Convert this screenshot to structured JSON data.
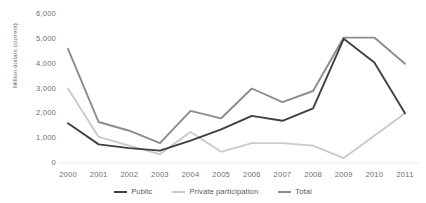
{
  "chart_data": {
    "type": "line",
    "title": "",
    "xlabel": "",
    "ylabel": "Million dollars (current)",
    "categories": [
      "2000",
      "2001",
      "2002",
      "2003",
      "2004",
      "2005",
      "2006",
      "2007",
      "2008",
      "2009",
      "2010",
      "2011"
    ],
    "ylim": [
      0,
      6000
    ],
    "ytick_labels": [
      "0",
      "1,000",
      "2,000",
      "3,000",
      "4,000",
      "5,000",
      "6,000"
    ],
    "ytick_values": [
      0,
      1000,
      2000,
      3000,
      4000,
      5000,
      6000
    ],
    "grid": false,
    "legend_position": "bottom",
    "series": [
      {
        "name": "Public",
        "color": "#404040",
        "values": [
          1600,
          750,
          600,
          500,
          900,
          1350,
          1900,
          1700,
          2200,
          5000,
          4050,
          2000
        ]
      },
      {
        "name": "Private participation",
        "color": "#c9cacc",
        "values": [
          3000,
          1050,
          700,
          350,
          1250,
          450,
          800,
          800,
          700,
          200,
          1100,
          2000
        ]
      },
      {
        "name": "Total",
        "color": "#8c8c8c",
        "values": [
          4600,
          1650,
          1300,
          800,
          2100,
          1800,
          3000,
          2450,
          2900,
          5050,
          5050,
          4000
        ]
      }
    ]
  },
  "axis": {
    "y_title": "Million dollars (current)"
  },
  "legend": {
    "items": [
      {
        "label": "Public",
        "color": "#404040"
      },
      {
        "label": "Private participation",
        "color": "#c9cacc"
      },
      {
        "label": "Total",
        "color": "#8c8c8c"
      }
    ]
  }
}
